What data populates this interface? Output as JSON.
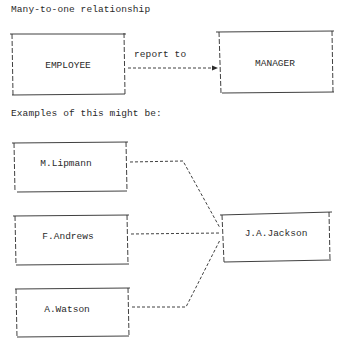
{
  "title": "Many-to-one relationship",
  "schema": {
    "entities": [
      {
        "id": "employee",
        "label": "EMPLOYEE"
      },
      {
        "id": "manager",
        "label": "MANAGER"
      }
    ],
    "relationship": {
      "label": "report to",
      "from": "employee",
      "to": "manager"
    }
  },
  "examples_heading": "Examples of this might be:",
  "examples": {
    "employees": [
      {
        "label": "M.Lipmann"
      },
      {
        "label": "F.Andrews"
      },
      {
        "label": "A.Watson"
      }
    ],
    "manager": {
      "label": "J.A.Jackson"
    }
  },
  "colors": {
    "ink": "#2a2a2a",
    "background": "#ffffff"
  }
}
